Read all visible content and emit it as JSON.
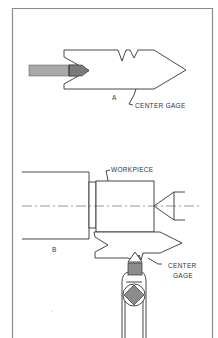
{
  "figure": {
    "part_a": {
      "label": "A",
      "callout": "CENTER GAGE"
    },
    "part_b": {
      "label": "B",
      "workpiece_callout": "WORKPIECE",
      "gage_callout_line1": "CENTER",
      "gage_callout_line2": "GAGE"
    },
    "colors": {
      "frame": "#8a8a8a",
      "ink": "#333333",
      "tool_shank": "#a8a8a8",
      "tool_tip": "#7a7a7a",
      "insert": "#8c8c8c"
    }
  }
}
